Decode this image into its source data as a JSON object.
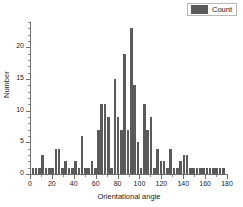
{
  "legend": {
    "label": "Count",
    "swatch_color": "#5a5a5a",
    "position": "top-right"
  },
  "chart_data": {
    "type": "bar",
    "title": "",
    "subtitle": "",
    "xlabel": "Orientational angle",
    "ylabel": "Number",
    "xlim": [
      0,
      180
    ],
    "ylim": [
      0,
      24
    ],
    "xticks": [
      0,
      20,
      40,
      60,
      80,
      100,
      120,
      140,
      160,
      180
    ],
    "yticks": [
      0,
      5,
      10,
      15,
      20
    ],
    "grid": false,
    "bar_color": "#5a5a5a",
    "bin_width": 3,
    "series": [
      {
        "name": "Count",
        "x": [
          2,
          5,
          8,
          11,
          14,
          17,
          20,
          23,
          26,
          29,
          32,
          35,
          38,
          41,
          44,
          47,
          50,
          53,
          56,
          59,
          62,
          65,
          68,
          71,
          74,
          77,
          80,
          83,
          86,
          89,
          92,
          95,
          98,
          101,
          104,
          107,
          110,
          113,
          116,
          119,
          122,
          125,
          128,
          131,
          134,
          137,
          140,
          143,
          146,
          149,
          152,
          155,
          158,
          161,
          164,
          167,
          170,
          173,
          176
        ],
        "values": [
          1,
          1,
          1,
          3,
          1,
          1,
          1,
          4,
          4,
          1,
          2,
          1,
          1,
          2,
          1,
          6,
          1,
          1,
          2,
          1,
          7,
          11,
          11,
          9,
          1,
          15,
          9,
          7,
          19,
          7,
          23,
          14,
          5,
          1,
          11,
          7,
          9,
          1,
          4,
          2,
          2,
          1,
          4,
          1,
          1,
          2,
          3,
          3,
          1,
          1,
          1,
          1,
          1,
          1,
          1,
          1,
          1,
          1,
          1
        ]
      }
    ]
  }
}
